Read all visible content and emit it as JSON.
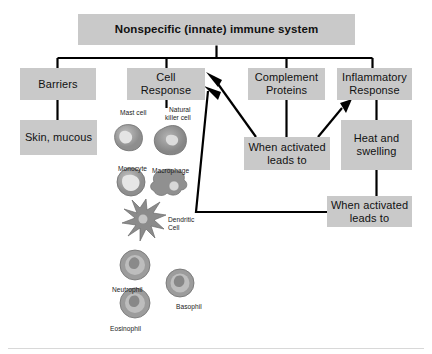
{
  "diagram": {
    "title": "Nonspecific (innate) immune system",
    "type": "hierarchy-flowchart",
    "box_fill": "#c9c9c9",
    "line_color": "#000000",
    "background": "#ffffff"
  },
  "nodes": {
    "root": {
      "label": "Nonspecific (innate) immune system"
    },
    "barriers": {
      "label": "Barriers"
    },
    "skin_mucous": {
      "label": "Skin, mucous"
    },
    "cell_response": {
      "label": "Cell\nResponse",
      "line1": "Cell",
      "line2": "Response"
    },
    "complement_proteins": {
      "label": "Complement\nProteins",
      "line1": "Complement",
      "line2": "Proteins"
    },
    "inflammatory_response": {
      "label": "Inflammatory\nResponse",
      "line1": "Inflammatory",
      "line2": "Response"
    },
    "when_activated_1": {
      "line1": "When activated",
      "line2": "leads to"
    },
    "heat_and_swelling": {
      "line1": "Heat and",
      "line2": "swelling"
    },
    "when_activated_2": {
      "line1": "When activated",
      "line2": "leads to"
    }
  },
  "cells": [
    {
      "name": "mast-cell",
      "label": "Mast cell"
    },
    {
      "name": "natural-killer-cell",
      "label": "Natural\nkiller cell",
      "line1": "Natural",
      "line2": "killer cell"
    },
    {
      "name": "monocyte",
      "label": "Monocyte"
    },
    {
      "name": "macrophage",
      "label": "Macrophage"
    },
    {
      "name": "dendritic-cell",
      "label": "Dendritic\nCell",
      "line1": "Dendritic",
      "line2": "Cell"
    },
    {
      "name": "neutrophil",
      "label": "Neutrophil"
    },
    {
      "name": "basophil",
      "label": "Basophil"
    },
    {
      "name": "eosinophil",
      "label": "Eosinophil"
    }
  ],
  "edges": [
    {
      "from": "root",
      "to": "barriers"
    },
    {
      "from": "root",
      "to": "cell_response"
    },
    {
      "from": "root",
      "to": "complement_proteins"
    },
    {
      "from": "root",
      "to": "inflammatory_response"
    },
    {
      "from": "barriers",
      "to": "skin_mucous"
    },
    {
      "from": "cell_response",
      "to": "cell_gallery"
    },
    {
      "from": "complement_proteins",
      "to": "when_activated_1"
    },
    {
      "from": "when_activated_1",
      "to": "cell_response",
      "arrow": true
    },
    {
      "from": "when_activated_1",
      "to": "inflammatory_response",
      "arrow": true
    },
    {
      "from": "inflammatory_response",
      "to": "heat_and_swelling"
    },
    {
      "from": "heat_and_swelling",
      "to": "when_activated_2"
    },
    {
      "from": "when_activated_2",
      "to": "cell_response",
      "arrow": true
    }
  ]
}
